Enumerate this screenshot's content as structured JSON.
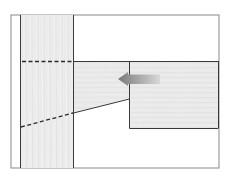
{
  "diagram": {
    "title": "",
    "colors": {
      "background": "#ffffff",
      "frame": "#8a8a8a",
      "line": "#3a3a3a",
      "wood": "#ebebeb",
      "wood_grain": "#dcdcdc",
      "arrow_dark": "#7a7a7a",
      "arrow_light": "#d8d8d8"
    },
    "parts": [
      {
        "id": "vertical-post",
        "label": ""
      },
      {
        "id": "tapered-tenon",
        "label": ""
      },
      {
        "id": "horizontal-rail",
        "label": ""
      },
      {
        "id": "insertion-arrow",
        "label": ""
      }
    ]
  }
}
